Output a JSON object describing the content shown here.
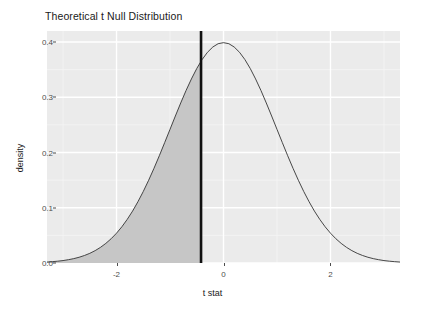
{
  "chart_data": {
    "type": "area",
    "title": "Theoretical t Null Distribution",
    "xlabel": "t stat",
    "ylabel": "density",
    "xlim": [
      -3.3,
      3.3
    ],
    "ylim": [
      0.0,
      0.42
    ],
    "grid": true,
    "legend": null,
    "theme": "ggplot2-gray",
    "x_ticks": [
      {
        "value": -2,
        "label": "-2"
      },
      {
        "value": 0,
        "label": "0"
      },
      {
        "value": 2,
        "label": "2"
      }
    ],
    "y_ticks": [
      {
        "value": 0.0,
        "label": "0.0"
      },
      {
        "value": 0.1,
        "label": "0.1"
      },
      {
        "value": 0.2,
        "label": "0.2"
      },
      {
        "value": 0.3,
        "label": "0.3"
      },
      {
        "value": 0.4,
        "label": "0.4"
      }
    ],
    "x_minor_ticks": [
      -3,
      -1,
      1,
      3
    ],
    "y_minor_ticks": [
      0.05,
      0.15,
      0.25,
      0.35
    ],
    "series": [
      {
        "name": "t null density",
        "kind": "line",
        "color": "#333333",
        "x": [
          -3.3,
          -3.2,
          -3.1,
          -3.0,
          -2.9,
          -2.8,
          -2.7,
          -2.6,
          -2.5,
          -2.4,
          -2.3,
          -2.2,
          -2.1,
          -2.0,
          -1.9,
          -1.8,
          -1.7,
          -1.6,
          -1.5,
          -1.4,
          -1.3,
          -1.2,
          -1.1,
          -1.0,
          -0.9,
          -0.8,
          -0.7,
          -0.6,
          -0.5,
          -0.4,
          -0.3,
          -0.2,
          -0.1,
          0.0,
          0.1,
          0.2,
          0.3,
          0.4,
          0.5,
          0.6,
          0.7,
          0.8,
          0.9,
          1.0,
          1.1,
          1.2,
          1.3,
          1.4,
          1.5,
          1.6,
          1.7,
          1.8,
          1.9,
          2.0,
          2.1,
          2.2,
          2.3,
          2.4,
          2.5,
          2.6,
          2.7,
          2.8,
          2.9,
          3.0,
          3.1,
          3.2,
          3.3
        ],
        "y": [
          0.0017,
          0.0024,
          0.0033,
          0.0044,
          0.006,
          0.0079,
          0.0104,
          0.0136,
          0.0175,
          0.0224,
          0.0283,
          0.0355,
          0.044,
          0.054,
          0.0656,
          0.079,
          0.094,
          0.1109,
          0.1295,
          0.1497,
          0.1714,
          0.1942,
          0.2179,
          0.242,
          0.2661,
          0.2897,
          0.3123,
          0.3332,
          0.3521,
          0.3683,
          0.3814,
          0.391,
          0.397,
          0.3989,
          0.397,
          0.391,
          0.3814,
          0.3683,
          0.3521,
          0.3332,
          0.3123,
          0.2897,
          0.2661,
          0.242,
          0.2179,
          0.1942,
          0.1714,
          0.1497,
          0.1295,
          0.1109,
          0.094,
          0.079,
          0.0656,
          0.054,
          0.044,
          0.0355,
          0.0283,
          0.0224,
          0.0175,
          0.0136,
          0.0104,
          0.0079,
          0.006,
          0.0044,
          0.0033,
          0.0024,
          0.0017
        ]
      },
      {
        "name": "rejection region shading",
        "kind": "area",
        "color": "#c6c6c6",
        "fill_from": -3.3,
        "fill_to": -0.42
      }
    ],
    "annotations": [
      {
        "name": "observed t stat line",
        "kind": "vline",
        "x": -0.42,
        "color": "#111111",
        "width": 2.6
      }
    ]
  },
  "chart": {
    "title": "Theoretical t Null Distribution",
    "x_axis_title": "t stat",
    "y_axis_title": "density"
  }
}
